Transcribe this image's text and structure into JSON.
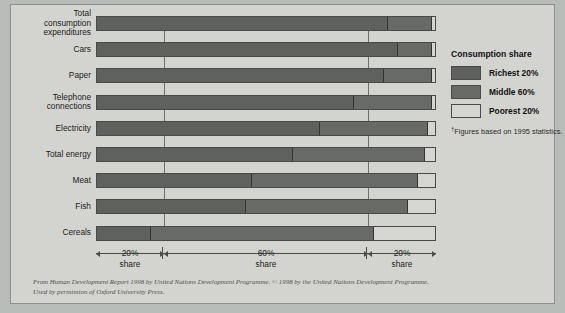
{
  "legend": {
    "title": "Consumption share",
    "items": [
      {
        "label": "Richest 20%",
        "color": "#5f615f",
        "key": "richest"
      },
      {
        "label": "Middle 60%",
        "color": "#686a67",
        "key": "middle"
      },
      {
        "label": "Poorest 20%",
        "color": "#d5d6d2",
        "key": "poorest"
      }
    ],
    "footnote_marker": "†",
    "footnote": "Figures based on 1995 statistics."
  },
  "axis": {
    "segments": [
      {
        "pct": "20%",
        "sub": "share",
        "start": 0,
        "end": 20
      },
      {
        "pct": "60%",
        "sub": "share",
        "start": 20,
        "end": 80
      },
      {
        "pct": "20%",
        "sub": "share",
        "start": 80,
        "end": 100
      }
    ],
    "gridlines": [
      20,
      80
    ]
  },
  "source": {
    "line1": "From Human Development Report 1998 by United Nations Development Programme. © 1998 by the United Nations Development Programme.",
    "line2": "Used by permission of Oxford University Press."
  },
  "chart_data": {
    "type": "bar",
    "orientation": "horizontal",
    "stacked": true,
    "title": "",
    "xlabel": "",
    "ylabel": "",
    "xlim": [
      0,
      100
    ],
    "grid": true,
    "legend_position": "right",
    "categories": [
      "Total consumption expenditures",
      "Cars",
      "Paper",
      "Telephone connections",
      "Electricity",
      "Total energy",
      "Meat",
      "Fish",
      "Cereals"
    ],
    "series": [
      {
        "name": "Richest 20%",
        "values": [
          86,
          89,
          85,
          76,
          66,
          58,
          46,
          44,
          16
        ]
      },
      {
        "name": "Middle 60%",
        "values": [
          13,
          10,
          14,
          23,
          32,
          39,
          49,
          48,
          66
        ]
      },
      {
        "name": "Poorest 20%",
        "values": [
          1,
          1,
          1,
          1,
          2,
          3,
          5,
          8,
          18
        ]
      }
    ],
    "rows": [
      {
        "label": "Total\nconsumption\nexpenditures",
        "richest": 86,
        "middle": 13,
        "poorest": 1
      },
      {
        "label": "Cars",
        "richest": 89,
        "middle": 10,
        "poorest": 1
      },
      {
        "label": "Paper",
        "richest": 85,
        "middle": 14,
        "poorest": 1
      },
      {
        "label": "Telephone\nconnections",
        "richest": 76,
        "middle": 23,
        "poorest": 1
      },
      {
        "label": "Electricity",
        "richest": 66,
        "middle": 32,
        "poorest": 2
      },
      {
        "label": "Total energy",
        "richest": 58,
        "middle": 39,
        "poorest": 3
      },
      {
        "label": "Meat",
        "richest": 46,
        "middle": 49,
        "poorest": 5
      },
      {
        "label": "Fish",
        "richest": 44,
        "middle": 48,
        "poorest": 8
      },
      {
        "label": "Cereals",
        "richest": 16,
        "middle": 66,
        "poorest": 18
      }
    ]
  }
}
